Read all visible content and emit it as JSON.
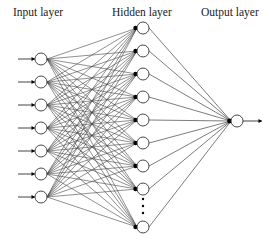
{
  "labels": {
    "input": "Input layer",
    "hidden": "Hidden layer",
    "output": "Output layer"
  },
  "colors": {
    "line": "#444444",
    "node_stroke": "#333333",
    "node_fill": "#ffffff",
    "arrowhead": "#000000",
    "text": "#222222"
  },
  "layers": {
    "input": {
      "x": 41,
      "ys": [
        59,
        82,
        105,
        128,
        151,
        174,
        197
      ],
      "arrow_start_x": 18
    },
    "hidden": {
      "x": 143,
      "ys": [
        28,
        51,
        74,
        97,
        120,
        143,
        166,
        189,
        227
      ],
      "ellipsis_ys": [
        199,
        206,
        213
      ]
    },
    "output": {
      "x": 237,
      "ys": [
        121
      ],
      "arrow_end_x": 262
    }
  },
  "node_radius": 6
}
